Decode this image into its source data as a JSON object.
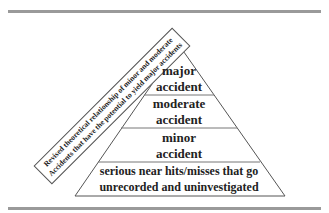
{
  "diagram": {
    "type": "pyramid",
    "side_label": {
      "line1": "Revised theoretical relationship of minor and moderate",
      "line2": "Accidents that have the potential to yield major accidents"
    },
    "tiers": [
      {
        "line1": "major",
        "line2": "accident"
      },
      {
        "line1": "moderate",
        "line2": "accident"
      },
      {
        "line1": "minor",
        "line2": "accident"
      },
      {
        "line1": "serious near hits/misses that go",
        "line2": "unrecorded and uninvestigated"
      }
    ],
    "colors": {
      "rule": "#9a9a9a",
      "outline": "#555555",
      "text": "#222222"
    }
  }
}
